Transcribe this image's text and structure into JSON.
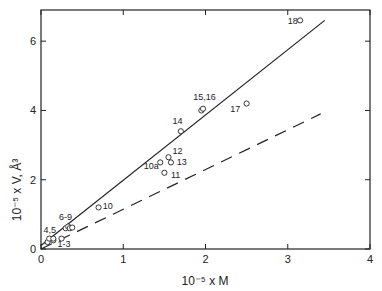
{
  "chart_data": {
    "type": "scatter",
    "title": "",
    "xlabel": "10⁻⁵ x M",
    "ylabel": "10⁻⁵ x V, Å³",
    "xlim": [
      0,
      4
    ],
    "ylim": [
      0,
      6.9
    ],
    "xticks": [
      0,
      1,
      2,
      3,
      4
    ],
    "yticks": [
      0,
      2,
      4,
      6
    ],
    "grid": false,
    "legend": null,
    "points": [
      {
        "label": "1-3",
        "x": 0.08,
        "y": 0.2
      },
      {
        "label": "1-3",
        "x": 0.15,
        "y": 0.25
      },
      {
        "label": "1-3",
        "x": 0.25,
        "y": 0.3
      },
      {
        "label": "4,5",
        "x": 0.1,
        "y": 0.3
      },
      {
        "label": "4,5",
        "x": 0.15,
        "y": 0.3
      },
      {
        "label": "6-9",
        "x": 0.3,
        "y": 0.6
      },
      {
        "label": "6-9",
        "x": 0.33,
        "y": 0.65
      },
      {
        "label": "6-9",
        "x": 0.35,
        "y": 0.6
      },
      {
        "label": "6-9",
        "x": 0.38,
        "y": 0.62
      },
      {
        "label": "10",
        "x": 0.7,
        "y": 1.2
      },
      {
        "label": "10a",
        "x": 1.45,
        "y": 2.5
      },
      {
        "label": "11",
        "x": 1.5,
        "y": 2.2
      },
      {
        "label": "12",
        "x": 1.55,
        "y": 2.65
      },
      {
        "label": "13",
        "x": 1.58,
        "y": 2.5
      },
      {
        "label": "14",
        "x": 1.7,
        "y": 3.4
      },
      {
        "label": "15,16",
        "x": 1.95,
        "y": 4.0
      },
      {
        "label": "15,16",
        "x": 1.97,
        "y": 4.05
      },
      {
        "label": "17",
        "x": 2.5,
        "y": 4.2
      },
      {
        "label": "18",
        "x": 3.15,
        "y": 6.6
      }
    ],
    "annotations": [
      {
        "text": "1-3",
        "x": 0.2,
        "y": 0.05
      },
      {
        "text": "4,5",
        "x": 0.03,
        "y": 0.45
      },
      {
        "text": "6-9",
        "x": 0.22,
        "y": 0.85
      },
      {
        "text": "10",
        "x": 0.75,
        "y": 1.15
      },
      {
        "text": "10a",
        "x": 1.25,
        "y": 2.3
      },
      {
        "text": "11",
        "x": 1.58,
        "y": 2.05
      },
      {
        "text": "12",
        "x": 1.6,
        "y": 2.75
      },
      {
        "text": "13",
        "x": 1.65,
        "y": 2.42
      },
      {
        "text": "14",
        "x": 1.6,
        "y": 3.6
      },
      {
        "text": "15,16",
        "x": 1.85,
        "y": 4.3
      },
      {
        "text": "17",
        "x": 2.3,
        "y": 3.95
      },
      {
        "text": "18",
        "x": 3.0,
        "y": 6.5
      }
    ],
    "lines": [
      {
        "name": "solid-fit",
        "style": "solid",
        "x": [
          0,
          3.45
        ],
        "y": [
          0.1,
          6.6
        ]
      },
      {
        "name": "dashed-fit",
        "style": "dashed",
        "x": [
          0,
          3.4
        ],
        "y": [
          0,
          3.9
        ]
      }
    ]
  },
  "colors": {
    "ink": "#222222",
    "background": "#ffffff"
  }
}
